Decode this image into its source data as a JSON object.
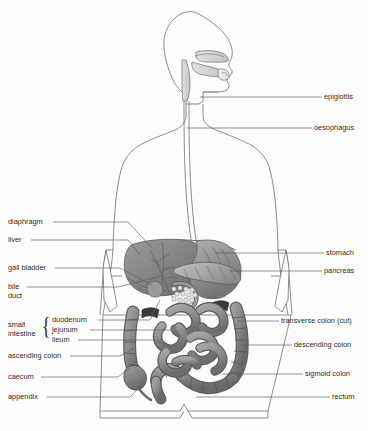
{
  "figure": {
    "view": "anterior torso with lateral head profile",
    "background_color": "#fdfdfd",
    "outline_color": "#6e6e6e",
    "leader_color": "#595959",
    "text_color": "#2b2b2b",
    "organ_fill_dark": "#6f6f6f",
    "organ_fill_mid": "#8d8d8d",
    "organ_fill_light": "#b4b4b4",
    "organ_fill_pale": "#d8d8d8"
  },
  "labels_left": [
    {
      "id": "diaphragm",
      "text": "diaphragm",
      "x": 8,
      "y": 218,
      "leader_x1": 53,
      "leader_y1": 222,
      "leader_x2": 128,
      "leader_y2": 222,
      "leader_x3": 152,
      "leader_y3": 248
    },
    {
      "id": "liver",
      "text": "liver",
      "x": 8,
      "y": 236,
      "leader_x1": 31,
      "leader_y1": 240,
      "leader_x2": 128,
      "leader_y2": 240,
      "leader_x3": 140,
      "leader_y3": 255
    },
    {
      "id": "gall-bladder",
      "text": "gall bladder",
      "x": 8,
      "y": 264,
      "leader_x1": 55,
      "leader_y1": 268,
      "leader_x2": 120,
      "leader_y2": 268,
      "leader_x3": 152,
      "leader_y3": 285
    },
    {
      "id": "bile-duct",
      "text": "bile",
      "text2": "duct",
      "x": 8,
      "y": 283,
      "leader_x1": 27,
      "leader_y1": 287,
      "leader_x2": 118,
      "leader_y2": 287,
      "leader_x3": 162,
      "leader_y3": 276
    },
    {
      "id": "duodenum",
      "text": "duodenum",
      "x": 52,
      "y": 316,
      "leader_x1": 98,
      "leader_y1": 320,
      "leader_x2": 150,
      "leader_y2": 320,
      "leader_x3": 160,
      "leader_y3": 300
    },
    {
      "id": "jejunum",
      "text": "jejunum",
      "x": 52,
      "y": 326,
      "leader_x1": 90,
      "leader_y1": 330,
      "leader_x2": 152,
      "leader_y2": 330,
      "leader_x3": 170,
      "leader_y3": 330
    },
    {
      "id": "ileum",
      "text": "ileum",
      "x": 52,
      "y": 336,
      "leader_x1": 78,
      "leader_y1": 340,
      "leader_x2": 155,
      "leader_y2": 340,
      "leader_x3": 172,
      "leader_y3": 348
    },
    {
      "id": "ascending-colon",
      "text": "ascending colon",
      "x": 8,
      "y": 352,
      "leader_x1": 70,
      "leader_y1": 356,
      "leader_x2": 120,
      "leader_y2": 356,
      "leader_x3": 134,
      "leader_y3": 348
    },
    {
      "id": "caecum",
      "text": "caecum",
      "x": 8,
      "y": 373,
      "leader_x1": 41,
      "leader_y1": 377,
      "leader_x2": 118,
      "leader_y2": 377,
      "leader_x3": 130,
      "leader_y3": 368
    },
    {
      "id": "appendix",
      "text": "appendix",
      "x": 8,
      "y": 393,
      "leader_x1": 47,
      "leader_y1": 397,
      "leader_x2": 130,
      "leader_y2": 397,
      "leader_x3": 144,
      "leader_y3": 382
    }
  ],
  "labels_right": [
    {
      "id": "epiglottis",
      "text": "epiglottis",
      "x": 324,
      "y": 93,
      "leader_x1": 200,
      "leader_y1": 97,
      "leader_x2": 322,
      "leader_y2": 97
    },
    {
      "id": "oesophagus",
      "text": "oesophagus",
      "x": 314,
      "y": 124,
      "leader_x1": 187,
      "leader_y1": 128,
      "leader_x2": 312,
      "leader_y2": 128
    },
    {
      "id": "stomach",
      "text": "stomach",
      "x": 326,
      "y": 249,
      "leader_x1": 215,
      "leader_y1": 253,
      "leader_x2": 324,
      "leader_y2": 253
    },
    {
      "id": "pancreas",
      "text": "pancreas",
      "x": 324,
      "y": 267,
      "leader_x1": 230,
      "leader_y1": 271,
      "leader_x2": 322,
      "leader_y2": 271
    },
    {
      "id": "transverse-colon-cut",
      "text": "transverse colon (cut)",
      "x": 281,
      "y": 317,
      "leader_x1": 238,
      "leader_y1": 321,
      "leader_x2": 279,
      "leader_y2": 321
    },
    {
      "id": "descending-colon",
      "text": "descending colon",
      "x": 294,
      "y": 341,
      "leader_x1": 240,
      "leader_y1": 345,
      "leader_x2": 292,
      "leader_y2": 345
    },
    {
      "id": "sigmoid-colon",
      "text": "sigmoid colon",
      "x": 305,
      "y": 370,
      "leader_x1": 222,
      "leader_y1": 374,
      "leader_x2": 303,
      "leader_y2": 374
    },
    {
      "id": "rectum",
      "text": "rectum",
      "x": 332,
      "y": 393,
      "leader_x1": 196,
      "leader_y1": 397,
      "leader_x2": 330,
      "leader_y2": 397
    }
  ],
  "group_label": {
    "id": "small-intestine",
    "line1": "small",
    "line2": "intestine",
    "x": 8,
    "y": 320,
    "brace": "{",
    "brace_x": 40,
    "brace_y": 313
  }
}
